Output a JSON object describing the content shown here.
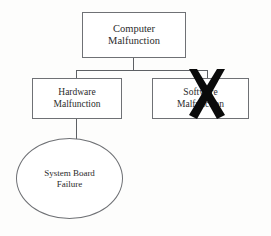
{
  "diagram": {
    "type": "fault-tree",
    "background_color": "#fdfdfc",
    "node_border_color": "#6f7175",
    "connector_color": "#5d6064",
    "text_color": "#2b2b2b",
    "crossout_color": "#000000",
    "nodes": {
      "root": {
        "label": "Computer\nMalfunction",
        "shape": "rectangle"
      },
      "hardware": {
        "label": "Hardware\nMalfunction",
        "shape": "rectangle"
      },
      "software": {
        "label": "Software\nMalfunction",
        "shape": "rectangle",
        "state": "crossed-out"
      },
      "system_board": {
        "label": "System Board\nFailure",
        "shape": "ellipse"
      }
    },
    "annotations": {
      "crossout_mark": "X"
    }
  }
}
